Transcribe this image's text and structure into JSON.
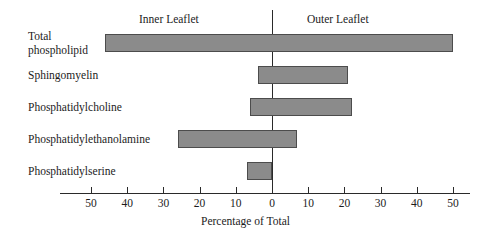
{
  "chart_data": {
    "type": "bar",
    "orientation": "horizontal",
    "title": "",
    "xlabel": "Percentage of Total",
    "ylabel": "",
    "xlim": [
      -55,
      55
    ],
    "grid": false,
    "zero_line": true,
    "legend": "none",
    "side_labels": {
      "left": "Inner Leaflet",
      "right": "Outer Leaflet"
    },
    "axis_ticks": [
      {
        "value": -50,
        "label": "50"
      },
      {
        "value": -40,
        "label": "40"
      },
      {
        "value": -30,
        "label": "30"
      },
      {
        "value": -20,
        "label": "20"
      },
      {
        "value": -10,
        "label": "10"
      },
      {
        "value": 0,
        "label": "0"
      },
      {
        "value": 10,
        "label": "10"
      },
      {
        "value": 20,
        "label": "20"
      },
      {
        "value": 30,
        "label": "30"
      },
      {
        "value": 40,
        "label": "40"
      },
      {
        "value": 50,
        "label": "50"
      }
    ],
    "categories": [
      "Total phospholipid",
      "Sphingomyelin",
      "Phosphatidylcholine",
      "Phosphatidylethanolamine",
      "Phosphatidylserine"
    ],
    "series": [
      {
        "name": "Inner Leaflet",
        "values": [
          46,
          4,
          6,
          26,
          7
        ]
      },
      {
        "name": "Outer Leaflet",
        "values": [
          50,
          21,
          22,
          7,
          0
        ]
      }
    ],
    "bars": [
      {
        "category": "Total phospholipid",
        "inner": 46,
        "outer": 50
      },
      {
        "category": "Sphingomyelin",
        "inner": 4,
        "outer": 21
      },
      {
        "category": "Phosphatidylcholine",
        "inner": 6,
        "outer": 22
      },
      {
        "category": "Phosphatidylethanolamine",
        "inner": 26,
        "outer": 7
      },
      {
        "category": "Phosphatidylserine",
        "inner": 7,
        "outer": 0
      }
    ],
    "colors": {
      "bar_fill": "#8b8b8b",
      "bar_border": "#4c4c4c",
      "axis": "#2a2a2a",
      "text": "#1c1c1c",
      "background": "#ffffff"
    }
  },
  "rows": [
    {
      "label_line1": "Total",
      "label_line2": "phospholipid"
    },
    {
      "label": "Sphingomyelin"
    },
    {
      "label": "Phosphatidylcholine"
    },
    {
      "label": "Phosphatidylethanolamine"
    },
    {
      "label": "Phosphatidylserine"
    }
  ]
}
